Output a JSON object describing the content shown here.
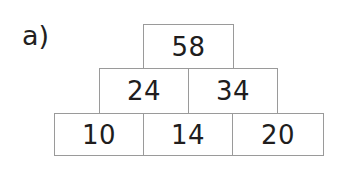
{
  "figure": {
    "part_label": "a)",
    "type": "number-pyramid",
    "background_color": "#ffffff",
    "border_color": "#9a9a9a",
    "text_color": "#201d1d",
    "rows": [
      {
        "level": "top",
        "cells": [
          {
            "value": "58"
          }
        ]
      },
      {
        "level": "middle",
        "cells": [
          {
            "value": "24"
          },
          {
            "value": "34"
          }
        ]
      },
      {
        "level": "bottom",
        "cells": [
          {
            "value": "10"
          },
          {
            "value": "14"
          },
          {
            "value": "20"
          }
        ]
      }
    ]
  }
}
